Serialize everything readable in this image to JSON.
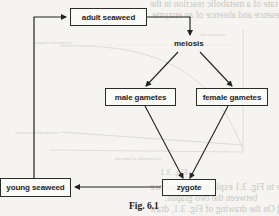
{
  "figure": {
    "caption": "Fig. 6.1"
  },
  "nodes": {
    "adult_seaweed": "adult seaweed",
    "meiosis": "meiosis",
    "male_gametes": "male gametes",
    "female_gametes": "female gametes",
    "zygote": "zygote",
    "young_seaweed": "young seaweed"
  },
  "edges": [
    {
      "from": "adult seaweed",
      "to": "meiosis"
    },
    {
      "from": "meiosis",
      "to": "male gametes"
    },
    {
      "from": "meiosis",
      "to": "female gametes"
    },
    {
      "from": "male gametes",
      "to": "zygote"
    },
    {
      "from": "female gametes",
      "to": "zygote"
    },
    {
      "from": "zygote",
      "to": "young seaweed"
    },
    {
      "from": "young seaweed",
      "to": "adult seaweed"
    }
  ],
  "bleed_through": {
    "line1": "concentration on the rate of a metabolic reaction in the",
    "line2": "presence and absence of an enzyme.",
    "fig31": "Fig. 3.1",
    "qa": "(a)  With reference to Fig. 3.1 explain the difference",
    "qa2": "between the two graphs.",
    "qb": "(b)  [Draw out Fig. 3.1] On the drawing of Fig. 3.1, draw",
    "axis_label": "concentration of substrate",
    "max_rate": "maximum rate",
    "with_enzyme": "reaction with enzyme",
    "without_enzyme": "reaction without enzyme"
  },
  "colors": {
    "ink": "#2b2b2b",
    "paper": "#f5f4f0",
    "bleed": "#c9c8c4"
  }
}
